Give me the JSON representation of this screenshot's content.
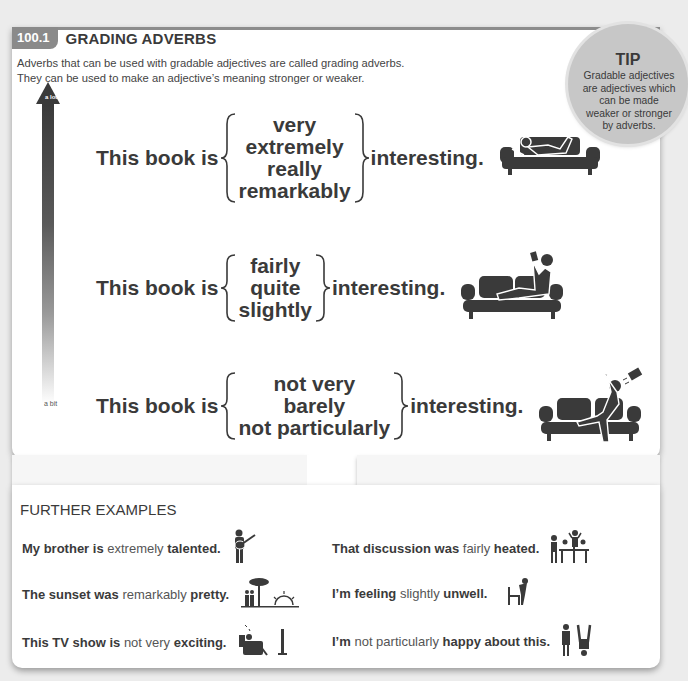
{
  "header": {
    "section_number": "100.1",
    "title": "GRADING ADVERBS",
    "intro_lines": [
      "Adverbs that can be used with gradable adjectives are called grading adverbs.",
      "They can be used to make an adjective’s meaning stronger or weaker."
    ]
  },
  "tip": {
    "title": "TIP",
    "text": "Gradable adjectives are adjectives which can be made weaker or stronger by adverbs."
  },
  "scale": {
    "top_label": "a lot",
    "bottom_label": "a bit"
  },
  "examples": [
    {
      "lead": "This book is",
      "adverbs": [
        "very",
        "extremely",
        "really",
        "remarkably"
      ],
      "tail": "interesting.",
      "icon": "person-lying-on-couch-icon"
    },
    {
      "lead": "This book is",
      "adverbs": [
        "fairly",
        "quite",
        "slightly"
      ],
      "tail": "interesting.",
      "icon": "person-reclining-reading-on-couch-icon"
    },
    {
      "lead": "This book is",
      "adverbs": [
        "not very",
        "barely",
        "not particularly"
      ],
      "tail": "interesting.",
      "icon": "person-throwing-book-on-couch-icon"
    }
  ],
  "further_examples": {
    "title": "FURTHER EXAMPLES",
    "items": [
      {
        "before": "My brother is ",
        "adverb": "extremely",
        "after": " talented.",
        "icon": "guitar-player-icon"
      },
      {
        "before": "That discussion was ",
        "adverb": "fairly",
        "after": " heated.",
        "icon": "people-arguing-at-table-icon"
      },
      {
        "before": "The sunset was ",
        "adverb": "remarkably",
        "after": " pretty.",
        "icon": "couple-watching-sunset-icon"
      },
      {
        "before": "I’m feeling ",
        "adverb": "slightly",
        "after": " unwell.",
        "icon": "person-feeling-sick-icon"
      },
      {
        "before": "This TV show is ",
        "adverb": "not very",
        "after": " exciting.",
        "icon": "person-sleeping-in-front-of-tv-icon"
      },
      {
        "before": "I’m ",
        "adverb": "not particularly",
        "after": " happy about this.",
        "icon": "upset-person-and-child-icon"
      }
    ]
  },
  "colors": {
    "text_dark": "#3a3a3a",
    "badge_gray": "#8a8a8a",
    "tip_circle": "#c7c7c7",
    "adverb_gray": "#555555",
    "background": "#ececec"
  }
}
